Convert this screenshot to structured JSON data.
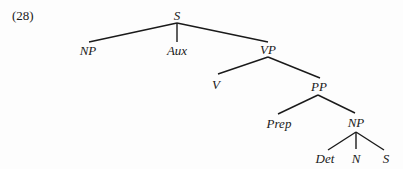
{
  "example_number": "(28)",
  "tree": {
    "nodes": {
      "s_root": "S",
      "np_subject": "NP",
      "aux": "Aux",
      "vp": "VP",
      "v": "V",
      "pp": "PP",
      "prep": "Prep",
      "np_object": "NP",
      "det": "Det",
      "n": "N",
      "s_embedded": "S"
    },
    "edges": [
      [
        "S",
        "NP"
      ],
      [
        "S",
        "Aux"
      ],
      [
        "S",
        "VP"
      ],
      [
        "VP",
        "V"
      ],
      [
        "VP",
        "PP"
      ],
      [
        "PP",
        "Prep"
      ],
      [
        "PP",
        "NP"
      ],
      [
        "NP",
        "Det"
      ],
      [
        "NP",
        "N"
      ],
      [
        "NP",
        "S"
      ]
    ]
  }
}
